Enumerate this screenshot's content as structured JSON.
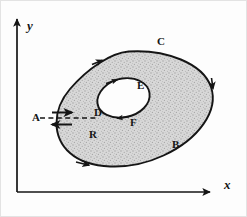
{
  "figure": {
    "type": "math-diagram",
    "background_color": "#fdfdfd",
    "ink_color": "#151515",
    "shading_color": "#c9c9c9"
  },
  "axes": {
    "x_label": "x",
    "y_label": "y",
    "origin": {
      "x": 17,
      "y": 192
    },
    "x_arrow_tip": {
      "x": 215,
      "y": 192
    },
    "y_arrow_tip": {
      "x": 17,
      "y": 14
    }
  },
  "curves": {
    "outer": {
      "label": "C",
      "orientation": "counterclockwise",
      "arrow_count": 3
    },
    "inner": {
      "labels": [
        "D",
        "E",
        "F"
      ],
      "orientation": "clockwise",
      "arrow_count": 2
    },
    "crosscut": {
      "style": "dashed",
      "from": "A",
      "to": "D",
      "arrow_forward": "right",
      "arrow_backward": "left"
    }
  },
  "labels": {
    "A": {
      "text": "A",
      "x": 32,
      "y": 117
    },
    "B": {
      "text": "B",
      "x": 172,
      "y": 144
    },
    "C": {
      "text": "C",
      "x": 157,
      "y": 41
    },
    "D": {
      "text": "D",
      "x": 94,
      "y": 112
    },
    "E": {
      "text": "E",
      "x": 137,
      "y": 85
    },
    "F": {
      "text": "F",
      "x": 130,
      "y": 122
    },
    "R": {
      "text": "R",
      "x": 89,
      "y": 134
    },
    "x": {
      "text": "x",
      "x": 224,
      "y": 185
    },
    "y": {
      "text": "y",
      "x": 27,
      "y": 26
    }
  }
}
